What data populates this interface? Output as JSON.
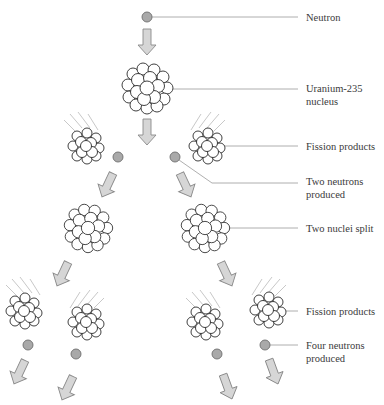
{
  "colors": {
    "neutron_fill": "#a9a9a9",
    "neutron_stroke": "#6e6e6e",
    "arrow_fill": "#d6d6d6",
    "arrow_stroke": "#8a8a8a",
    "nucleus_stroke": "#2b2b2b",
    "leader_line": "#9a9a9a",
    "label_text": "#3a3a3a"
  },
  "labels": [
    {
      "id": "neutron",
      "lines": [
        "Neutron"
      ]
    },
    {
      "id": "uranium",
      "lines": [
        "Uranium-235",
        "nucleus"
      ]
    },
    {
      "id": "fission1",
      "lines": [
        "Fission products"
      ]
    },
    {
      "id": "two_neutrons",
      "lines": [
        "Two neutrons",
        "produced"
      ]
    },
    {
      "id": "two_split",
      "lines": [
        "Two nuclei split"
      ]
    },
    {
      "id": "fission2",
      "lines": [
        "Fission products"
      ]
    },
    {
      "id": "four_neutrons",
      "lines": [
        "Four neutrons",
        "produced"
      ]
    }
  ]
}
